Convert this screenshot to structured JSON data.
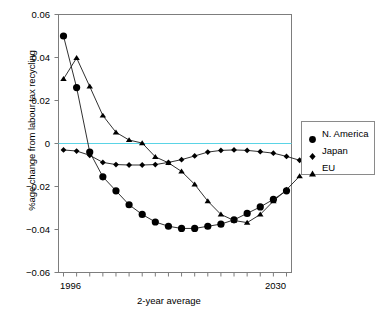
{
  "chart_data": {
    "type": "line",
    "title": "",
    "xlabel": "2-year average",
    "ylabel": "%age change from labour tax recycling",
    "ylim": [
      -0.06,
      0.06
    ],
    "yticks": [
      0.06,
      0.04,
      0.02,
      0,
      -0.02,
      -0.04,
      -0.06
    ],
    "ytick_labels": [
      "0.06",
      "0.04",
      "0.02",
      "0",
      "−0.02",
      "−0.04",
      "−0.06"
    ],
    "xtick_labels": [
      "1996",
      "2030"
    ],
    "x_first_label": "1996",
    "x_last_label": "2030",
    "n_points": 18,
    "grid": false,
    "zero_line": true,
    "zero_line_color": "#5ad4e6",
    "legend_position": "right-outside",
    "series": [
      {
        "name": "N. America",
        "marker": "circle",
        "color": "#000000",
        "values": [
          0.05,
          0.026,
          -0.004,
          -0.0155,
          -0.022,
          -0.0285,
          -0.033,
          -0.0365,
          -0.0385,
          -0.0395,
          -0.0395,
          -0.0385,
          -0.0375,
          -0.0355,
          -0.0325,
          -0.0295,
          -0.026,
          -0.022
        ]
      },
      {
        "name": "Japan",
        "marker": "diamond",
        "color": "#000000",
        "values": [
          -0.003,
          -0.0035,
          -0.0055,
          -0.0088,
          -0.0098,
          -0.01,
          -0.01,
          -0.0098,
          -0.0088,
          -0.0075,
          -0.0058,
          -0.004,
          -0.0032,
          -0.003,
          -0.0032,
          -0.0038,
          -0.0045,
          -0.006,
          -0.0078
        ]
      },
      {
        "name": "EU",
        "marker": "triangle",
        "color": "#000000",
        "values": [
          0.03,
          0.0398,
          0.0265,
          0.013,
          0.0052,
          0.0016,
          0.0002,
          -0.0062,
          -0.009,
          -0.013,
          -0.019,
          -0.0268,
          -0.033,
          -0.0358,
          -0.0368,
          -0.033,
          -0.0268,
          -0.0215,
          -0.0152
        ]
      }
    ]
  },
  "legend": {
    "items": [
      {
        "label": "N. America",
        "marker": "circle"
      },
      {
        "label": "Japan",
        "marker": "diamond"
      },
      {
        "label": "EU",
        "marker": "triangle"
      }
    ]
  },
  "axis": {
    "y_title": "%age change from labour tax recycling",
    "x_title": "2-year average"
  }
}
